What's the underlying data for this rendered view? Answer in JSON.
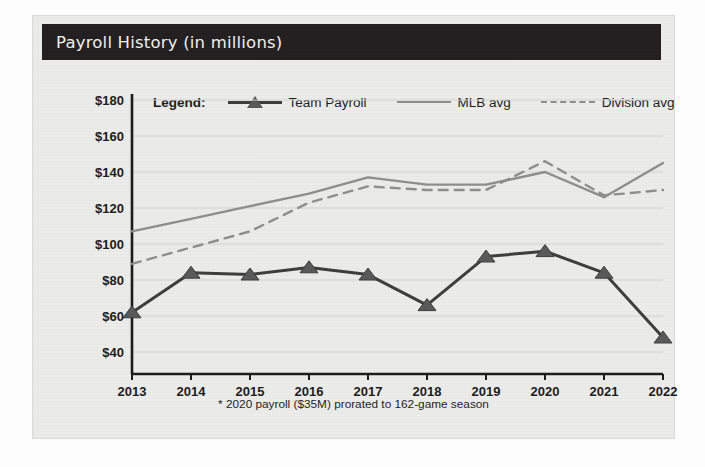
{
  "card": {
    "title": "Payroll History (in millions)",
    "footnote": "* 2020 payroll ($35M) prorated to 162-game season",
    "title_bar_color": "#231f20",
    "card_background": "#ececeb"
  },
  "legend": {
    "title": "Legend:",
    "entries": [
      {
        "label": "Team Payroll",
        "style": "solid-with-triangle-marker",
        "color": "#3d3d3d"
      },
      {
        "label": "MLB avg",
        "style": "solid",
        "color": "#8e8e8e"
      },
      {
        "label": "Division avg",
        "style": "dashed",
        "color": "#8e8e8e"
      }
    ]
  },
  "chart_data": {
    "type": "line",
    "title": "Payroll History (in millions)",
    "xlabel": "",
    "ylabel": "",
    "x": [
      "2013",
      "2014",
      "2015",
      "2016",
      "2017",
      "2018",
      "2019",
      "2020",
      "2021",
      "2022"
    ],
    "categories": [
      "2013",
      "2014",
      "2015",
      "2016",
      "2017",
      "2018",
      "2019",
      "2020",
      "2021",
      "2022"
    ],
    "ylim": [
      30,
      185
    ],
    "ytick_values": [
      180,
      160,
      140,
      120,
      100,
      80,
      60,
      40
    ],
    "ytick_labels": [
      "$180",
      "$160",
      "$140",
      "$120",
      "$100",
      "$80",
      "$60",
      "$40"
    ],
    "grid": true,
    "grid_axis": "y",
    "legend_position": "top",
    "series": [
      {
        "name": "Team Payroll",
        "color": "#3d3d3d",
        "style": "solid",
        "marker": "triangle",
        "values": [
          62,
          84,
          83,
          87,
          83,
          66,
          93,
          96,
          84,
          48
        ]
      },
      {
        "name": "MLB avg",
        "color": "#8e8e8e",
        "style": "solid",
        "marker": "none",
        "values": [
          107,
          114,
          121,
          128,
          137,
          133,
          133,
          140,
          126,
          145
        ]
      },
      {
        "name": "Division avg",
        "color": "#8e8e8e",
        "style": "dashed",
        "marker": "none",
        "values": [
          89,
          98,
          107,
          123,
          132,
          130,
          130,
          146,
          127,
          130
        ]
      }
    ],
    "annotations": [
      "* 2020 payroll ($35M) prorated to 162-game season"
    ]
  }
}
